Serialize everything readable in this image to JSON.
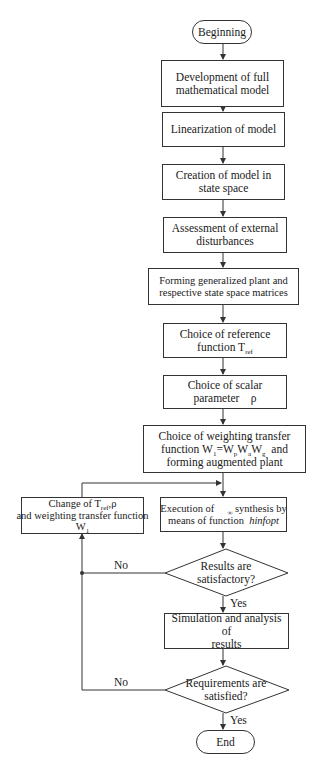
{
  "flowchart": {
    "start": "Beginning",
    "end": "End",
    "steps": {
      "development": [
        "Development of full",
        "mathematical model"
      ],
      "linearization": "Linearization of model",
      "creation": [
        "Creation of model in",
        "state space"
      ],
      "assessment": [
        "Assessment of external",
        "disturbances"
      ],
      "forming": [
        "Forming generalized plant and",
        "respective state space matrices"
      ],
      "choice_reference": {
        "line1": "Choice of reference",
        "line2_prefix": "function  T",
        "line2_sub": "ref"
      },
      "choice_scalar": {
        "line1": "Choice of scalar",
        "line2": "parameter    ρ"
      },
      "choice_weighting": {
        "line1": "Choice of weighting transfer",
        "line2_prefix": "function W",
        "w1_sub": "1",
        "eq": "=W",
        "wp_sub": "p",
        "w": "W",
        "wa_sub": "a",
        "wg_sub": "g",
        "line2_suffix": "  and",
        "line3": "forming augmented plant"
      },
      "change": {
        "line1_prefix": "Change of  T",
        "line1_sub": "ref",
        "line1_suffix": ",ρ",
        "line2": "and weighting transfer function",
        "line3_prefix": "W",
        "line3_sub": "1"
      },
      "execution": {
        "line1_prefix": "Execution of ",
        "line1_sub": "∞",
        "line1_suffix": " synthesis by",
        "line2_prefix": "means of function  ",
        "line2_italic": "hinfopt"
      },
      "simulation": [
        "Simulation and analysis of",
        "results"
      ]
    },
    "decisions": {
      "results": [
        "Results are",
        "satisfactory?"
      ],
      "requirements": [
        "Requirements are",
        "satisfied?"
      ]
    },
    "edge_labels": {
      "results_no": "No",
      "results_yes": "Yes",
      "requirements_no": "No",
      "requirements_yes": "Yes"
    },
    "colors": {
      "stroke": "#333333",
      "background": "#ffffff",
      "text": "#1a1a1a"
    }
  }
}
